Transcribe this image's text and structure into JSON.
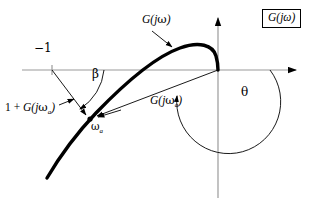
{
  "figure": {
    "kind": "nyquist-polar-plot",
    "background": "#ffffff",
    "axis_color": "#9a9a9a",
    "curve_color": "#000000",
    "annotation_color": "#000000"
  },
  "labels": {
    "minus_one": "−1",
    "curve_label_prefix": "G(",
    "curve_label_j": "j",
    "curve_label_omega": "ω",
    "curve_label_suffix": ")",
    "beta": "β",
    "theta": "θ",
    "omega_a": "ω",
    "omega_a_sub": "a",
    "one_plus_prefix": "1 + ",
    "boxed_title": "G(jω)"
  },
  "annotations": [
    {
      "name": "critical-point-label",
      "text": "−1",
      "x": 36,
      "y": 48,
      "describes": "critical point at -1 on real axis"
    },
    {
      "name": "curve-name-label",
      "text": "G(jω)",
      "x": 143,
      "y": 18,
      "describes": "open loop frequency response locus"
    },
    {
      "name": "beta-angle-label",
      "text": "β",
      "x": 94,
      "y": 74,
      "describes": "angle beta between negative real axis and 1+G vector"
    },
    {
      "name": "theta-angle-label",
      "text": "θ",
      "x": 243,
      "y": 92,
      "describes": "phase angle theta of G(j omega a)"
    },
    {
      "name": "vector-one-plus-g-label",
      "text": "1 + G(jωa)",
      "x": 6,
      "y": 106,
      "describes": "vector from -1 point to the locus point"
    },
    {
      "name": "vector-g-label",
      "text": "G(jωa)",
      "x": 151,
      "y": 99,
      "describes": "vector from origin to the locus point"
    },
    {
      "name": "omega-a-point-label",
      "text": "ωa",
      "x": 94,
      "y": 123,
      "describes": "frequency omega a marker on the locus"
    },
    {
      "name": "boxed-figure-title",
      "text": "G(jω)",
      "x": 265,
      "y": 12,
      "describes": "boxed legend in top right corner"
    }
  ],
  "geometry": {
    "origin": {
      "x": 218,
      "y": 70
    },
    "minus_one_point": {
      "x": 52,
      "y": 70
    },
    "omega_a_point": {
      "x": 90,
      "y": 119
    },
    "real_axis": {
      "x1": 22,
      "y1": 70,
      "x2": 300,
      "y2": 70
    },
    "imag_axis": {
      "x1": 218,
      "y1": 14,
      "x2": 218,
      "y2": 198
    }
  }
}
